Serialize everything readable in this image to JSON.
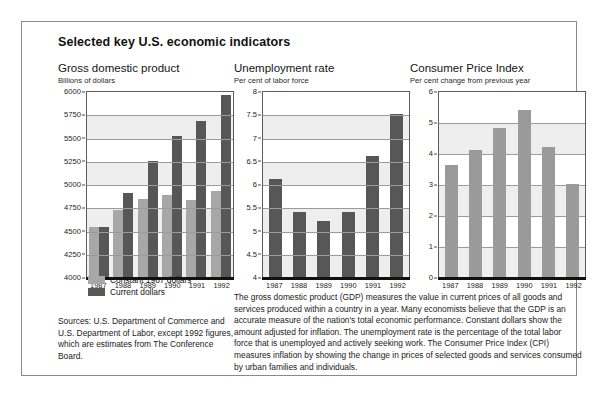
{
  "scan_sliver_text": " ",
  "figure": {
    "title": "Selected key U.S. economic indicators",
    "legend": [
      {
        "label": "Constant 1987 dollars",
        "color": "#a7a7a7",
        "swatch": "light"
      },
      {
        "label": "Current dollars",
        "color": "#575757",
        "swatch": "dark"
      }
    ],
    "sources": "Sources: U.S. Department of Commerce and U.S. Department of Labor, except 1992 figures, which are estimates from The Conference Board.",
    "body_copy": "The gross domestic product (GDP) measures the value in current prices of all goods and services produced within a country in a year. Many economists believe that the GDP is an accurate measure of the nation's total economic performance. Constant dollars show the amount adjusted for inflation. The unemployment rate is the percentage of the total labor force that is unemployed and actively seeking work. The Consumer Price Index (CPI) measures inflation by showing the change in prices of selected goods and services consumed by urban families and individuals."
  },
  "chart_data": [
    {
      "type": "bar",
      "title": "Gross domestic product",
      "subtitle": "Billions of dollars",
      "xlabel": "",
      "ylabel": "Billions of dollars",
      "categories": [
        "1987",
        "1988",
        "1989",
        "1990",
        "1991",
        "1992"
      ],
      "ylim": [
        4000,
        6000
      ],
      "yticks": [
        "6000",
        "5750",
        "5500",
        "5250",
        "5000",
        "4750",
        "4500",
        "4250",
        "4000"
      ],
      "ytick_values": [
        6000,
        5750,
        5500,
        5250,
        5000,
        4750,
        4500,
        4250,
        4000
      ],
      "grid": true,
      "legend_position": "below-left",
      "series": [
        {
          "name": "Constant 1987 dollars",
          "color": "#a7a7a7",
          "values": [
            4540,
            4720,
            4840,
            4880,
            4830,
            4920
          ]
        },
        {
          "name": "Current dollars",
          "color": "#575757",
          "values": [
            4540,
            4900,
            5250,
            5520,
            5680,
            5960
          ]
        }
      ]
    },
    {
      "type": "bar",
      "title": "Unemployment rate",
      "subtitle": "Per cent of labor force",
      "xlabel": "",
      "ylabel": "Per cent of labor force",
      "categories": [
        "1987",
        "1988",
        "1989",
        "1990",
        "1991",
        "1992"
      ],
      "ylim": [
        4,
        8
      ],
      "yticks": [
        "8",
        "7.5",
        "7",
        "6.5",
        "6",
        "5.5",
        "5",
        "4.5",
        "4"
      ],
      "ytick_values": [
        8,
        7.5,
        7,
        6.5,
        6,
        5.5,
        5,
        4.5,
        4
      ],
      "grid": true,
      "series": [
        {
          "name": "Unemployment rate",
          "color": "#575757",
          "values": [
            6.1,
            5.4,
            5.2,
            5.4,
            6.6,
            7.5
          ]
        }
      ]
    },
    {
      "type": "bar",
      "title": "Consumer Price Index",
      "subtitle": "Per cent change from previous year",
      "xlabel": "",
      "ylabel": "Per cent change from previous year",
      "categories": [
        "1987",
        "1988",
        "1989",
        "1990",
        "1991",
        "1992"
      ],
      "ylim": [
        0,
        6
      ],
      "yticks": [
        "6",
        "5",
        "4",
        "3",
        "2",
        "1",
        "0"
      ],
      "ytick_values": [
        6,
        5,
        4,
        3,
        2,
        1,
        0
      ],
      "grid": true,
      "series": [
        {
          "name": "Consumer Price Index",
          "color": "#9a9a9a",
          "values": [
            3.6,
            4.1,
            4.8,
            5.4,
            4.2,
            3.0
          ]
        }
      ]
    }
  ]
}
